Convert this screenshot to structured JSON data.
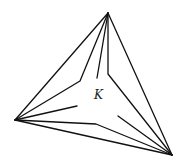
{
  "diagram": {
    "label": "K",
    "label_pos": [
      94,
      99
    ],
    "vertices": {
      "top": [
        108,
        13
      ],
      "left": [
        15,
        120
      ],
      "right": [
        172,
        155
      ]
    },
    "outer_edges": [
      [
        [
          108,
          13
        ],
        [
          15,
          120
        ]
      ],
      [
        [
          108,
          13
        ],
        [
          172,
          155
        ]
      ],
      [
        [
          15,
          120
        ],
        [
          172,
          155
        ]
      ]
    ],
    "inner_paths": [
      [
        [
          108,
          13
        ],
        [
          80,
          81
        ],
        [
          15,
          120
        ]
      ],
      [
        [
          108,
          13
        ],
        [
          97,
          78
        ]
      ],
      [
        [
          108,
          13
        ],
        [
          108,
          74
        ],
        [
          172,
          155
        ]
      ],
      [
        [
          15,
          120
        ],
        [
          77,
          106
        ]
      ],
      [
        [
          15,
          120
        ],
        [
          96,
          124
        ],
        [
          172,
          155
        ]
      ],
      [
        [
          172,
          155
        ],
        [
          118,
          116
        ]
      ]
    ],
    "colors": {
      "stroke": "#111111",
      "background": "#ffffff"
    }
  }
}
